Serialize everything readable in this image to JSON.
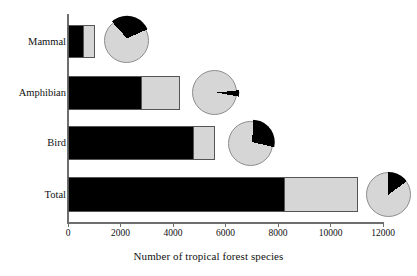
{
  "chart_data": {
    "type": "bar",
    "orientation": "horizontal",
    "stacked": true,
    "title": "",
    "xlabel": "Number of tropical forest species",
    "ylabel": "",
    "xlim": [
      0,
      12000
    ],
    "xticks": [
      0,
      2000,
      4000,
      6000,
      8000,
      10000,
      12000
    ],
    "xtick_labels": [
      "0",
      "2000",
      "4000",
      "6000",
      "8000",
      "10000",
      "12000"
    ],
    "grid": false,
    "legend": "none",
    "categories": [
      "Mammal",
      "Amphibian",
      "Bird",
      "Total"
    ],
    "series": [
      {
        "name": "black-segment",
        "color": "#000000",
        "values": [
          570,
          2790,
          4800,
          8230
        ]
      },
      {
        "name": "gray-segment",
        "color": "#d6d6d6",
        "values": [
          460,
          1460,
          800,
          2820
        ]
      }
    ],
    "totals": [
      1030,
      4250,
      5600,
      11050
    ],
    "pies": [
      {
        "category": "Mammal",
        "black_fraction": 0.3,
        "gray_fraction": 0.7,
        "start_angle_deg": 318,
        "exploded": true
      },
      {
        "category": "Amphibian",
        "black_fraction": 0.045,
        "gray_fraction": 0.955,
        "start_angle_deg": 84,
        "exploded": true
      },
      {
        "category": "Bird",
        "black_fraction": 0.28,
        "gray_fraction": 0.72,
        "start_angle_deg": 2,
        "exploded": true
      },
      {
        "category": "Total",
        "black_fraction": 0.15,
        "gray_fraction": 0.85,
        "start_angle_deg": 0,
        "exploded": false
      }
    ]
  },
  "axis": {
    "xlabel": "Number of tropical forest species",
    "ticks": [
      {
        "value": 0,
        "label": "0"
      },
      {
        "value": 2000,
        "label": "2000"
      },
      {
        "value": 4000,
        "label": "4000"
      },
      {
        "value": 6000,
        "label": "6000"
      },
      {
        "value": 8000,
        "label": "8000"
      },
      {
        "value": 10000,
        "label": "10000"
      },
      {
        "value": 12000,
        "label": "12000"
      }
    ]
  },
  "rows": [
    {
      "label": "Mammal",
      "black": 570,
      "gray": 460,
      "top": 25,
      "height": 33,
      "pie_left": 104,
      "pie_top": 18,
      "pie_size": 45
    },
    {
      "label": "Amphibian",
      "black": 2790,
      "gray": 1460,
      "top": 76,
      "height": 34,
      "pie_left": 192,
      "pie_top": 70,
      "pie_size": 45
    },
    {
      "label": "Bird",
      "black": 4800,
      "gray": 800,
      "top": 126,
      "height": 34,
      "pie_left": 228,
      "pie_top": 121,
      "pie_size": 45
    },
    {
      "label": "Total",
      "black": 8230,
      "gray": 2820,
      "top": 177,
      "height": 35,
      "pie_left": 366,
      "pie_top": 172,
      "pie_size": 45
    }
  ],
  "colors": {
    "black_segment": "#000000",
    "gray_segment": "#d6d6d6",
    "axis": "#6e6e6e",
    "outline": "#555555",
    "background": "#ffffff"
  }
}
